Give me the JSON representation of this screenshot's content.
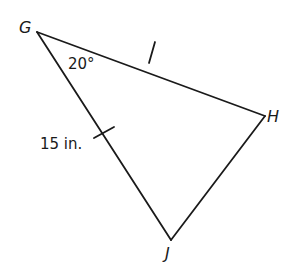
{
  "figure": {
    "vertices": {
      "G": {
        "label": "G",
        "x": 37,
        "y": 32
      },
      "H": {
        "label": "H",
        "x": 265,
        "y": 116
      },
      "J": {
        "label": "J",
        "x": 171,
        "y": 240
      }
    },
    "angle_label": "20°",
    "side_label": "15 in.",
    "line_color": "#1a1a1a",
    "congruence_marks": [
      "GH",
      "GJ"
    ]
  }
}
